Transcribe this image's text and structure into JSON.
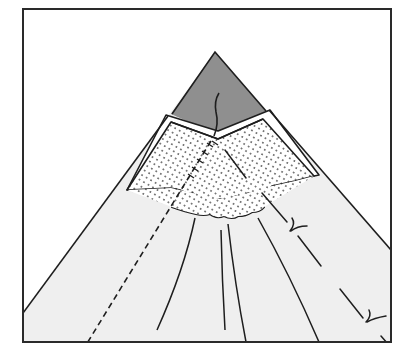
{
  "figure": {
    "type": "line-art folding illustration",
    "colors": {
      "background": "#ffffff",
      "frame_stroke": "#2a2a2a",
      "body_fill": "#efefef",
      "tip_fill": "#8f8f8f",
      "flap_fill": "#ffffff",
      "dot_color": "#555555",
      "line_color": "#1e1e1e"
    },
    "elements": [
      "frame",
      "paper-body",
      "grey-tip",
      "white-border-band",
      "dotted-flap",
      "radial-fold-lines",
      "dashed-fold-line",
      "dash-dot-fold-line",
      "fold-marks"
    ]
  }
}
